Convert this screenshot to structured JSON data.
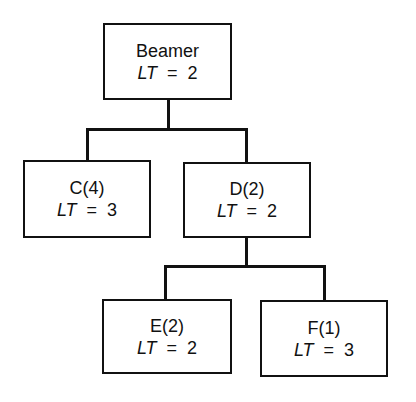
{
  "diagram": {
    "type": "tree",
    "nodes": [
      {
        "id": "beamer",
        "name": "Beamer",
        "metric_var": "LT",
        "metric_op": "=",
        "metric_value": "2",
        "parent": null
      },
      {
        "id": "c",
        "name": "C(4)",
        "metric_var": "LT",
        "metric_op": "=",
        "metric_value": "3",
        "parent": "beamer"
      },
      {
        "id": "d",
        "name": "D(2)",
        "metric_var": "LT",
        "metric_op": "=",
        "metric_value": "2",
        "parent": "beamer"
      },
      {
        "id": "e",
        "name": "E(2)",
        "metric_var": "LT",
        "metric_op": "=",
        "metric_value": "2",
        "parent": "d"
      },
      {
        "id": "f",
        "name": "F(1)",
        "metric_var": "LT",
        "metric_op": "=",
        "metric_value": "3",
        "parent": "d"
      }
    ],
    "colors": {
      "line": "#111111",
      "background": "#ffffff"
    }
  }
}
